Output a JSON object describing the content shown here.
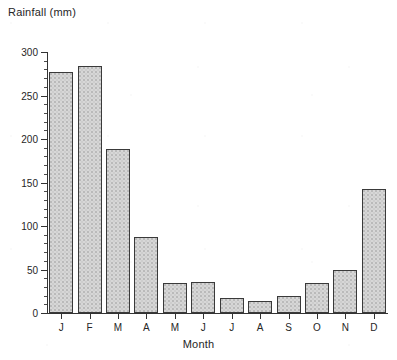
{
  "chart_data": {
    "type": "bar",
    "title": "",
    "ylabel": "Rainfall (mm)",
    "xlabel": "Month",
    "categories": [
      "J",
      "F",
      "M",
      "A",
      "M",
      "J",
      "J",
      "A",
      "S",
      "O",
      "N",
      "D"
    ],
    "category_full_names": [
      "January",
      "February",
      "March",
      "April",
      "May",
      "June",
      "July",
      "August",
      "September",
      "October",
      "November",
      "December"
    ],
    "values": [
      277,
      284,
      188,
      87,
      35,
      36,
      17,
      14,
      20,
      35,
      50,
      142
    ],
    "ylim": [
      0,
      300
    ],
    "xlim_note": "12 categorical bars, equal spacing",
    "ytick_labels": [
      "0",
      "50",
      "100",
      "150",
      "200",
      "250",
      "300"
    ],
    "ytick_values": [
      0,
      50,
      100,
      150,
      200,
      250,
      300
    ],
    "yminor_interval": 10,
    "grid": false,
    "legend": null,
    "bar_fill_color": "#d7d7d7",
    "bar_edge_color": "#3a3a3a",
    "axis_color": "#333333",
    "text_color": "#262626",
    "background_color": "#ffffff",
    "spines": [
      "left",
      "bottom"
    ]
  }
}
